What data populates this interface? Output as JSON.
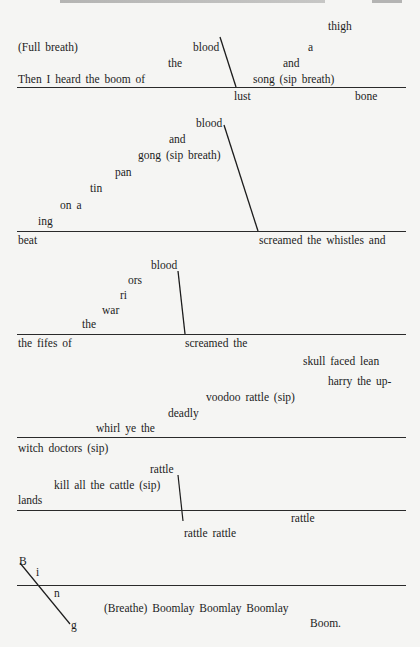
{
  "header": {
    "running_head_cropped": true,
    "page_number_cropped": true
  },
  "stanza1": {
    "thigh": "thigh",
    "full_breath": "(Full breath)",
    "blood": "blood",
    "a": "a",
    "the": "the",
    "and": "and",
    "main_line": "Then I heard the boom of",
    "song": "song (sip breath)",
    "lust": "lust",
    "bone": "bone"
  },
  "stanza2": {
    "blood": "blood",
    "and": "and",
    "gong": "gong (sip breath)",
    "pan": "pan",
    "tin": "tin",
    "on_a": "on a",
    "ing": "ing",
    "beat": "beat",
    "screamed": "screamed the whistles and"
  },
  "stanza3": {
    "blood": "blood",
    "ors": "ors",
    "ri": "ri",
    "war": "war",
    "the": "the",
    "fifes": "the fifes of",
    "screamed": "screamed the",
    "skull": "skull faced lean"
  },
  "stanza4": {
    "harry": "harry the up-",
    "voodoo": "voodoo rattle (sip)",
    "deadly": "deadly",
    "whirl": "whirl ye the",
    "witch": "witch doctors (sip)"
  },
  "stanza5": {
    "rattle_top": "rattle",
    "kill": "kill all the cattle (sip)",
    "lands": "lands",
    "rattle_right": "rattle",
    "rattle_rattle": "rattle rattle"
  },
  "stanza6": {
    "b": "B",
    "i": "i",
    "n": "n",
    "g": "g",
    "boomlay": "(Breathe) Boomlay Boomlay Boomlay",
    "boom": "Boom."
  },
  "colors": {
    "paper": "#f5f5f3",
    "ink": "#1c1c1c"
  }
}
